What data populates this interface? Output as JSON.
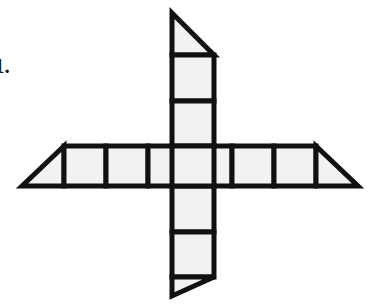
{
  "figure": {
    "colors": {
      "background": "#ffffff",
      "cell_fill": "#f2f2f2",
      "stroke": "#111111"
    },
    "stroke_width": 5,
    "cell_size": 42,
    "geometry": {
      "center_x": 190,
      "center_y": 166,
      "horizontal_band_top": 146,
      "horizontal_band_bottom": 186,
      "vertical_band_left": 169,
      "vertical_band_right": 211
    },
    "horizontal_arm": {
      "squares_left_of_center": 3,
      "squares_right_of_center": 2,
      "total_squares": 6,
      "left_cap": "right-triangle",
      "right_cap": "right-triangle"
    },
    "vertical_arm": {
      "squares_above_center": 2,
      "squares_below_center": 2,
      "total_squares": 4,
      "top_cap": "right-triangle",
      "bottom_cap": "right-triangle"
    },
    "counts": {
      "squares": 9,
      "triangles": 4
    }
  },
  "list_marker": {
    "label": "1.",
    "note": "partially cropped at left edge of image"
  }
}
